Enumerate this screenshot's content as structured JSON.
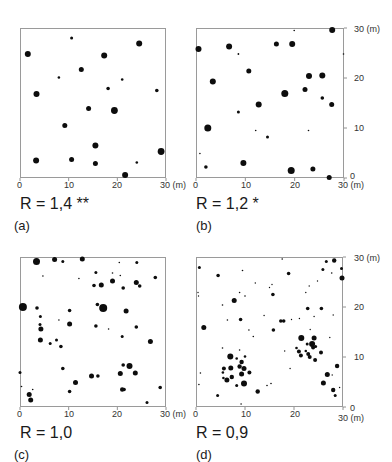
{
  "figure": {
    "unit_label": "(m)",
    "axis_ticks": [
      "0",
      "10",
      "20",
      "30 (m)"
    ],
    "right_axis_ticks": [
      "0",
      "10",
      "20",
      "30 (m)"
    ]
  },
  "panels": [
    {
      "letter": "(a)",
      "r_label": "R = 1,4 **"
    },
    {
      "letter": "(b)",
      "r_label": "R = 1,2 *"
    },
    {
      "letter": "(c)",
      "r_label": "R = 1,0"
    },
    {
      "letter": "(d)",
      "r_label": "R = 0,9"
    }
  ],
  "chart_data": [
    {
      "type": "scatter",
      "title": "(a) R = 1,4 **",
      "xlabel": "(m)",
      "ylabel": "",
      "xlim": [
        0,
        30
      ],
      "ylim": [
        0,
        30
      ],
      "x_ticks": [
        0,
        10,
        20,
        30
      ],
      "grid": false,
      "points": [
        [
          1.6,
          24.8,
          3
        ],
        [
          10.6,
          28.0,
          1.5
        ],
        [
          24.5,
          26.9,
          3
        ],
        [
          17.3,
          24.5,
          3
        ],
        [
          12.6,
          21.7,
          2.5
        ],
        [
          8.0,
          20.1,
          1.3
        ],
        [
          21.0,
          19.7,
          1.3
        ],
        [
          18.1,
          17.9,
          1.8
        ],
        [
          28.1,
          17.5,
          1.8
        ],
        [
          3.4,
          16.8,
          3
        ],
        [
          14.1,
          13.9,
          2.5
        ],
        [
          19.4,
          13.5,
          3.4
        ],
        [
          9.2,
          10.5,
          2.5
        ],
        [
          15.5,
          6.5,
          3
        ],
        [
          29.0,
          5.3,
          3.4
        ],
        [
          3.3,
          3.5,
          3
        ],
        [
          10.6,
          3.7,
          2.5
        ],
        [
          15.5,
          2.9,
          2.5
        ],
        [
          24.0,
          3.1,
          1.3
        ],
        [
          21.6,
          0.6,
          3
        ]
      ]
    },
    {
      "type": "scatter",
      "title": "(b) R = 1,2 *",
      "xlabel": "(m)",
      "ylabel": "(m)",
      "xlim": [
        0,
        30
      ],
      "ylim": [
        0,
        30
      ],
      "x_ticks": [
        0,
        10,
        20,
        30
      ],
      "y_ticks": [
        0,
        10,
        20,
        30
      ],
      "grid": false,
      "points": [
        [
          0.5,
          25.8,
          3
        ],
        [
          6.7,
          26.3,
          3
        ],
        [
          16.3,
          26.8,
          2.5
        ],
        [
          19.5,
          26.8,
          3
        ],
        [
          27.6,
          29.6,
          3
        ],
        [
          19.9,
          29.5,
          0.8
        ],
        [
          8.6,
          24.8,
          0.9
        ],
        [
          29.9,
          24.8,
          0.8
        ],
        [
          10.7,
          21.4,
          2.5
        ],
        [
          22.9,
          20.4,
          3
        ],
        [
          25.6,
          20.5,
          3
        ],
        [
          3.4,
          19.3,
          3
        ],
        [
          18.0,
          16.9,
          3.5
        ],
        [
          22.1,
          17.7,
          2.5
        ],
        [
          25.6,
          16.0,
          1.8
        ],
        [
          27.5,
          14.7,
          2.5
        ],
        [
          12.7,
          14.7,
          3
        ],
        [
          8.6,
          13.2,
          1.5
        ],
        [
          2.4,
          10.0,
          3.5
        ],
        [
          12.1,
          9.5,
          0.8
        ],
        [
          14.5,
          8.2,
          1.5
        ],
        [
          22.8,
          9.5,
          0.8
        ],
        [
          0.8,
          4.9,
          0.8
        ],
        [
          2.0,
          2.2,
          1.8
        ],
        [
          9.6,
          3.0,
          3
        ],
        [
          19.3,
          1.5,
          3.5
        ],
        [
          23.7,
          1.8,
          2.5
        ],
        [
          27.0,
          0.1,
          2.5
        ]
      ]
    },
    {
      "type": "scatter",
      "title": "(c) R = 1,0",
      "xlabel": "(m)",
      "ylabel": "",
      "xlim": [
        0,
        30
      ],
      "ylim": [
        0,
        30
      ],
      "x_ticks": [
        0,
        10,
        20,
        30
      ],
      "grid": false,
      "points": [
        [
          3.4,
          29.1,
          3.5
        ],
        [
          7.1,
          29.5,
          2.5
        ],
        [
          8.8,
          29.1,
          1.5
        ],
        [
          12.8,
          29.6,
          2.5
        ],
        [
          20.4,
          28.9,
          0.8
        ],
        [
          24.0,
          28.9,
          1.5
        ],
        [
          4.7,
          26.2,
          0.8
        ],
        [
          12.1,
          25.7,
          0.8
        ],
        [
          15.6,
          26.9,
          1.5
        ],
        [
          19.0,
          26.8,
          0.8
        ],
        [
          20.6,
          26.3,
          0.8
        ],
        [
          27.8,
          25.9,
          1.8
        ],
        [
          15.2,
          24.3,
          1.8
        ],
        [
          16.7,
          24.4,
          2.5
        ],
        [
          19.0,
          25.2,
          2.5
        ],
        [
          21.2,
          23.8,
          1.8
        ],
        [
          23.9,
          24.9,
          2.5
        ],
        [
          24.6,
          24.2,
          1.8
        ],
        [
          0.6,
          20.0,
          4
        ],
        [
          3.5,
          19.8,
          1.8
        ],
        [
          10.2,
          19.3,
          1.8
        ],
        [
          15.9,
          20.5,
          1.8
        ],
        [
          17.1,
          19.8,
          4
        ],
        [
          21.8,
          19.2,
          2.5
        ],
        [
          4.2,
          18.1,
          1.5
        ],
        [
          8.0,
          17.4,
          0.8
        ],
        [
          4.1,
          16.5,
          1.5
        ],
        [
          10.2,
          16.6,
          2.5
        ],
        [
          15.6,
          16.2,
          1.8
        ],
        [
          18.2,
          15.6,
          0.8
        ],
        [
          23.9,
          16.0,
          1.8
        ],
        [
          4.3,
          15.6,
          2.5
        ],
        [
          21.0,
          14.1,
          1.5
        ],
        [
          4.2,
          13.4,
          2.5
        ],
        [
          7.5,
          13.4,
          1.5
        ],
        [
          6.2,
          12.7,
          1.5
        ],
        [
          8.4,
          12.1,
          1.8
        ],
        [
          26.8,
          13.1,
          2.5
        ],
        [
          8.8,
          7.7,
          1.8
        ],
        [
          21.2,
          8.4,
          1.8
        ],
        [
          22.5,
          8.2,
          3
        ],
        [
          20.6,
          6.7,
          2.5
        ],
        [
          23.7,
          6.8,
          2.5
        ],
        [
          0.0,
          6.9,
          1.5
        ],
        [
          14.7,
          6.2,
          2.5
        ],
        [
          16.0,
          6.2,
          1.8
        ],
        [
          11.4,
          4.9,
          2.5
        ],
        [
          0.3,
          4.1,
          0.8
        ],
        [
          2.6,
          3.5,
          0.8
        ],
        [
          10.2,
          3.1,
          1.8
        ],
        [
          21.0,
          3.5,
          2.2
        ],
        [
          21.4,
          3.5,
          1.8
        ],
        [
          28.8,
          3.9,
          1.8
        ],
        [
          1.9,
          2.5,
          2.5
        ],
        [
          2.2,
          1.4,
          2.5
        ],
        [
          26.1,
          0.9,
          1.5
        ]
      ]
    },
    {
      "type": "scatter",
      "title": "(d) R = 0,9",
      "xlabel": "(m)",
      "ylabel": "(m)",
      "xlim": [
        0,
        30
      ],
      "ylim": [
        0,
        30
      ],
      "x_ticks": [
        0,
        10,
        20,
        30
      ],
      "y_ticks": [
        0,
        10,
        20,
        30
      ],
      "grid": false,
      "points": [
        [
          0.7,
          27.9,
          1.5
        ],
        [
          4.5,
          26.3,
          1.8
        ],
        [
          9.5,
          27.3,
          0.8
        ],
        [
          17.6,
          29.6,
          0.8
        ],
        [
          18.9,
          26.7,
          1.8
        ],
        [
          26.6,
          29.1,
          1.5
        ],
        [
          28.2,
          29.3,
          2.2
        ],
        [
          25.9,
          27.5,
          1.5
        ],
        [
          27.7,
          26.8,
          0.8
        ],
        [
          29.7,
          27.7,
          1.5
        ],
        [
          29.8,
          25.8,
          2.5
        ],
        [
          0.4,
          22.9,
          0.7
        ],
        [
          0.5,
          22.2,
          0.7
        ],
        [
          5.4,
          20.4,
          0.8
        ],
        [
          7.8,
          21.3,
          2.5
        ],
        [
          8.9,
          22.9,
          0.8
        ],
        [
          10.0,
          22.2,
          0.8
        ],
        [
          12.1,
          24.8,
          0.7
        ],
        [
          15.0,
          23.9,
          0.7
        ],
        [
          15.5,
          24.5,
          0.7
        ],
        [
          15.7,
          22.5,
          1.8
        ],
        [
          22.4,
          22.9,
          0.7
        ],
        [
          23.1,
          24.2,
          0.7
        ],
        [
          24.8,
          25.2,
          0.7
        ],
        [
          22.8,
          19.7,
          1.8
        ],
        [
          25.6,
          19.7,
          1.8
        ],
        [
          24.1,
          18.1,
          0.7
        ],
        [
          28.0,
          18.4,
          0.7
        ],
        [
          6.4,
          17.4,
          0.8
        ],
        [
          9.1,
          17.5,
          1.8
        ],
        [
          13.9,
          18.3,
          0.7
        ],
        [
          17.3,
          17.2,
          1.8
        ],
        [
          17.9,
          17.2,
          1.8
        ],
        [
          19.5,
          17.5,
          0.7
        ],
        [
          21.1,
          17.7,
          0.7
        ],
        [
          1.6,
          15.9,
          2.5
        ],
        [
          10.8,
          15.4,
          0.8
        ],
        [
          11.7,
          14.1,
          0.8
        ],
        [
          15.8,
          15.4,
          1.8
        ],
        [
          23.3,
          15.5,
          0.7
        ],
        [
          21.5,
          13.8,
          3
        ],
        [
          24.1,
          13.8,
          2.5
        ],
        [
          22.7,
          12.6,
          1.5
        ],
        [
          23.7,
          12.6,
          3
        ],
        [
          23.9,
          11.9,
          2
        ],
        [
          24.4,
          12.1,
          1.5
        ],
        [
          20.5,
          11.8,
          1.3
        ],
        [
          21.0,
          11.1,
          2
        ],
        [
          22.4,
          11.2,
          1.3
        ],
        [
          21.4,
          10.3,
          2
        ],
        [
          22.9,
          10.6,
          2
        ],
        [
          23.2,
          10.0,
          2
        ],
        [
          24.3,
          9.4,
          2
        ],
        [
          25.5,
          10.9,
          2
        ],
        [
          27.3,
          13.9,
          0.7
        ],
        [
          18.1,
          11.2,
          0.7
        ],
        [
          19.2,
          7.7,
          0.7
        ],
        [
          5.4,
          11.8,
          0.8
        ],
        [
          8.9,
          11.4,
          0.8
        ],
        [
          7.0,
          10.1,
          3
        ],
        [
          8.3,
          9.7,
          1.3
        ],
        [
          10.0,
          10.1,
          1.3
        ],
        [
          9.3,
          9.0,
          2.2
        ],
        [
          8.9,
          8.1,
          2.2
        ],
        [
          7.1,
          7.8,
          2.5
        ],
        [
          5.7,
          7.7,
          2
        ],
        [
          9.8,
          7.7,
          2.5
        ],
        [
          10.9,
          6.9,
          2
        ],
        [
          5.5,
          6.9,
          1.3
        ],
        [
          9.3,
          6.6,
          2.5
        ],
        [
          7.3,
          6.0,
          2.2
        ],
        [
          6.3,
          5.4,
          2.5
        ],
        [
          5.6,
          5.8,
          1.3
        ],
        [
          9.8,
          4.7,
          3
        ],
        [
          8.3,
          4.3,
          1.5
        ],
        [
          0.9,
          6.8,
          0.8
        ],
        [
          0.6,
          4.5,
          0.8
        ],
        [
          26.8,
          6.5,
          2.5
        ],
        [
          28.8,
          8.2,
          2.2
        ],
        [
          27.8,
          6.4,
          0.7
        ],
        [
          26.0,
          4.8,
          2.5
        ],
        [
          28.0,
          3.4,
          2.2
        ],
        [
          28.4,
          2.3,
          1.5
        ],
        [
          29.3,
          3.9,
          0.7
        ],
        [
          14.5,
          4.3,
          0.8
        ],
        [
          15.3,
          4.7,
          0.8
        ],
        [
          12.6,
          3.1,
          2.2
        ],
        [
          4.4,
          2.3,
          1.5
        ],
        [
          9.2,
          0.6,
          0.8
        ]
      ]
    }
  ]
}
